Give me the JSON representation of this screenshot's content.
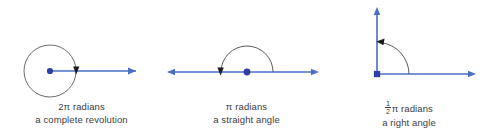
{
  "figure": {
    "colors": {
      "ray": "#4a6ec4",
      "arc": "#4a4a4a",
      "circle": "#5a5a5a",
      "vertex_dot": "#2f3fa8",
      "text": "#3d3d3d",
      "background": "#ffffff"
    },
    "panels": [
      {
        "id": "full-revolution",
        "name": "complete-revolution-diagram",
        "angle_label": "2π radians",
        "angle_symbol_prefix": "2",
        "angle_symbol": "π",
        "angle_unit": "radians",
        "description": "a complete revolution",
        "shape": "circle-with-ray",
        "arc_direction": "counterclockwise-full",
        "arrow_count": 2
      },
      {
        "id": "straight-angle",
        "name": "straight-angle-diagram",
        "angle_label": "π radians",
        "angle_symbol_prefix": "",
        "angle_symbol": "π",
        "angle_unit": "radians",
        "description": "a straight angle",
        "shape": "line-with-semicircle-arc",
        "arc_direction": "counterclockwise-half",
        "arrow_count": 3
      },
      {
        "id": "right-angle",
        "name": "right-angle-diagram",
        "angle_label_numerator": "1",
        "angle_label_denominator": "2",
        "angle_symbol": "π",
        "angle_unit": "radians",
        "description": "a right angle",
        "shape": "two-rays-with-quarter-arc",
        "arc_direction": "counterclockwise-quarter",
        "arrow_count": 3
      }
    ]
  }
}
